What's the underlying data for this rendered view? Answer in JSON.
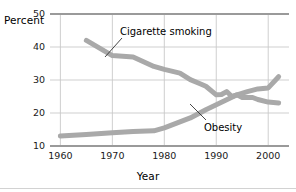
{
  "chart_data": {
    "type": "line",
    "title": "",
    "xlabel": "Year",
    "ylabel": "Percent",
    "xlim": [
      1958,
      2004
    ],
    "ylim": [
      10,
      50
    ],
    "xticks": [
      1960,
      1970,
      1980,
      1990,
      2000
    ],
    "yticks": [
      10,
      20,
      30,
      40,
      50
    ],
    "grid": true,
    "legend_position": "inline-annotations",
    "series": [
      {
        "name": "Cigarette smoking",
        "color": "#a9a9a9",
        "points": [
          [
            1965,
            42.0
          ],
          [
            1970,
            37.4
          ],
          [
            1974,
            37.0
          ],
          [
            1978,
            34.1
          ],
          [
            1980,
            33.2
          ],
          [
            1983,
            32.1
          ],
          [
            1985,
            30.1
          ],
          [
            1987,
            28.8
          ],
          [
            1988,
            28.1
          ],
          [
            1990,
            25.5
          ],
          [
            1991,
            25.6
          ],
          [
            1992,
            26.5
          ],
          [
            1993,
            25.0
          ],
          [
            1994,
            25.5
          ],
          [
            1995,
            24.7
          ],
          [
            1997,
            24.7
          ],
          [
            1998,
            24.1
          ],
          [
            2000,
            23.3
          ],
          [
            2002,
            23.0
          ]
        ]
      },
      {
        "name": "Obesity",
        "color": "#a9a9a9",
        "points": [
          [
            1960,
            13.0
          ],
          [
            1965,
            13.5
          ],
          [
            1970,
            14.0
          ],
          [
            1974,
            14.4
          ],
          [
            1978,
            14.6
          ],
          [
            1980,
            15.5
          ],
          [
            1985,
            18.5
          ],
          [
            1988,
            21.0
          ],
          [
            1990,
            22.5
          ],
          [
            1992,
            24.0
          ],
          [
            1994,
            25.5
          ],
          [
            1996,
            26.5
          ],
          [
            1998,
            27.3
          ],
          [
            2000,
            27.6
          ],
          [
            2002,
            31.0
          ]
        ]
      }
    ]
  },
  "axes": {
    "y_title": "Percent",
    "x_title": "Year",
    "y_ticks": [
      "10",
      "20",
      "30",
      "40",
      "50"
    ],
    "x_ticks": [
      "1960",
      "1970",
      "1980",
      "1990",
      "2000"
    ]
  },
  "annotations": {
    "smoking_label": "Cigarette smoking",
    "obesity_label": "Obesity"
  },
  "colors": {
    "line": "#a9a9a9",
    "grid": "#c9c9c9",
    "axis": "#9a9a9a",
    "text": "#000000"
  }
}
